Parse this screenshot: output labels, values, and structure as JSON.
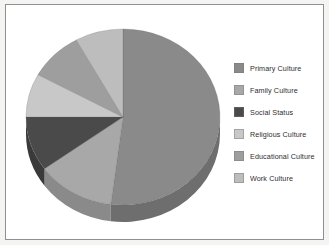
{
  "frame": {
    "border_color": "#8e9094",
    "background_color": "#ffffff",
    "page_background": "#f4f4f2"
  },
  "chart_data": {
    "type": "pie",
    "title": "",
    "subtitle": "",
    "xlabel": "",
    "ylabel": "",
    "grid": false,
    "legend_position": "right",
    "start_angle_deg": 0,
    "direction": "clockwise",
    "three_d": true,
    "categories": [
      "Primary Culture",
      "Family Culture",
      "Social Status",
      "Religious Culture",
      "Educational Culture",
      "Work Culture"
    ],
    "values": [
      52,
      13,
      10,
      8,
      9,
      8
    ],
    "colors": [
      "#8a8a8a",
      "#a8a8a8",
      "#4a4a4a",
      "#c8c8c8",
      "#9e9e9e",
      "#bdbdbd"
    ],
    "side_colors": [
      "#6e6e6e",
      "#8a8a8a",
      "#3a3a3a",
      "#a4a4a4",
      "#7e7e7e",
      "#999999"
    ]
  },
  "legend": {
    "items": [
      {
        "label": "Primary Culture",
        "color": "#8a8a8a"
      },
      {
        "label": "Family Culture",
        "color": "#a8a8a8"
      },
      {
        "label": "Social Status",
        "color": "#4a4a4a"
      },
      {
        "label": "Religious Culture",
        "color": "#c8c8c8"
      },
      {
        "label": "Educational Culture",
        "color": "#9e9e9e"
      },
      {
        "label": "Work Culture",
        "color": "#bdbdbd"
      }
    ]
  }
}
